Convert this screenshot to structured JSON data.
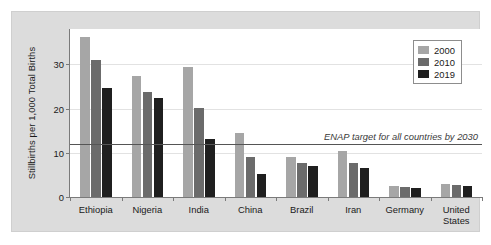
{
  "chart_data": {
    "type": "bar",
    "title": "",
    "subtitle": "",
    "xlabel": "",
    "ylabel": "Stillbirths per 1,000 Total Births",
    "ylim": [
      0,
      38
    ],
    "yticks": [
      0,
      10,
      20,
      30
    ],
    "ytick_labels": [
      "0",
      "10",
      "20",
      "30"
    ],
    "grid": true,
    "legend_position": "top-right",
    "categories": [
      "Ethiopia",
      "Nigeria",
      "India",
      "China",
      "Brazil",
      "Iran",
      "Germany",
      "United States"
    ],
    "series": [
      {
        "name": "2000",
        "color": "#a6a6a6",
        "values": [
          36.2,
          27.4,
          29.5,
          14.5,
          9.0,
          10.5,
          2.5,
          3.0
        ]
      },
      {
        "name": "2010",
        "color": "#6b6b6b",
        "values": [
          31.0,
          23.7,
          20.1,
          9.1,
          7.6,
          7.6,
          2.2,
          2.8
        ]
      },
      {
        "name": "2019",
        "color": "#1f1f1f",
        "values": [
          24.7,
          22.3,
          13.1,
          5.1,
          7.0,
          6.6,
          2.0,
          2.6
        ]
      }
    ],
    "annotations": [
      {
        "text": "ENAP target for all countries by 2030",
        "y": 12,
        "style": "italic",
        "line": true
      }
    ]
  },
  "legend": {
    "items": [
      {
        "label": "2000",
        "color": "#a6a6a6"
      },
      {
        "label": "2010",
        "color": "#6b6b6b"
      },
      {
        "label": "2019",
        "color": "#1f1f1f"
      }
    ]
  }
}
